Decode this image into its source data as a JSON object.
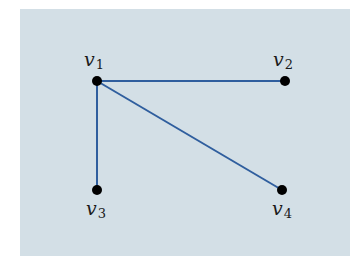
{
  "diagram": {
    "type": "graph",
    "colors": {
      "background": "#d3dfe6",
      "edge": "#2f5e9e",
      "node": "#000000"
    },
    "nodes": [
      {
        "id": "v1",
        "label": "v",
        "sub": "1",
        "x": 97,
        "y": 81
      },
      {
        "id": "v2",
        "label": "v",
        "sub": "2",
        "x": 285,
        "y": 81
      },
      {
        "id": "v3",
        "label": "v",
        "sub": "3",
        "x": 97,
        "y": 190
      },
      {
        "id": "v4",
        "label": "v",
        "sub": "4",
        "x": 282,
        "y": 190
      }
    ],
    "edges": [
      {
        "from": "v1",
        "to": "v2"
      },
      {
        "from": "v1",
        "to": "v3"
      },
      {
        "from": "v1",
        "to": "v4"
      }
    ]
  }
}
